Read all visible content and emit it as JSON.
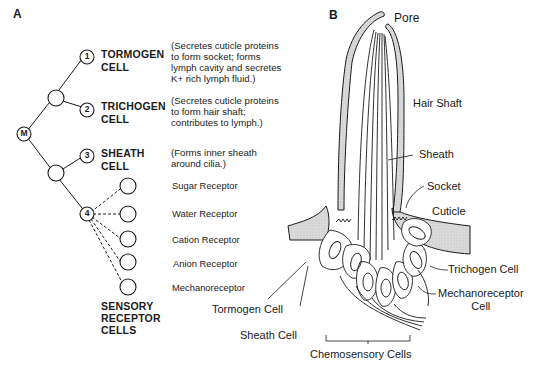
{
  "panels": {
    "a": {
      "label": "A",
      "root_node": "M",
      "cells": [
        {
          "number": "1",
          "name_line1": "TORMOGEN",
          "name_line2": "CELL",
          "description": [
            "(Secretes cuticle proteins",
            "to form socket; forms",
            "lymph cavity and secretes",
            "K+ rich lymph fluid.)"
          ]
        },
        {
          "number": "2",
          "name_line1": "TRICHOGEN",
          "name_line2": "CELL",
          "description": [
            "(Secretes cuticle proteins",
            "to form hair shaft;",
            "contributes to lymph.)"
          ]
        },
        {
          "number": "3",
          "name_line1": "SHEATH",
          "name_line2": "CELL",
          "description": [
            "(Forms inner sheath",
            "around cilia.)"
          ]
        },
        {
          "number": "4"
        }
      ],
      "receptors": [
        "Sugar Receptor",
        "Water Receptor",
        "Cation Receptor",
        "Anion Receptor",
        "Mechanoreceptor"
      ],
      "sensory_group_label": [
        "SENSORY",
        "RECEPTOR",
        "CELLS"
      ]
    },
    "b": {
      "label": "B",
      "labels": {
        "pore": "Pore",
        "hair_shaft": "Hair Shaft",
        "sheath": "Sheath",
        "socket": "Socket",
        "cuticle": "Cuticle",
        "trichogen_cell": "Trichogen Cell",
        "mechanoreceptor_cell_line1": "Mechanoreceptor",
        "mechanoreceptor_cell_line2": "Cell",
        "tormogen_cell": "Tormogen Cell",
        "sheath_cell": "Sheath Cell",
        "chemosensory_cells": "Chemosensory Cells"
      }
    }
  },
  "colors": {
    "line": "#1a1a1a",
    "shaded": "#d6d6d6"
  }
}
